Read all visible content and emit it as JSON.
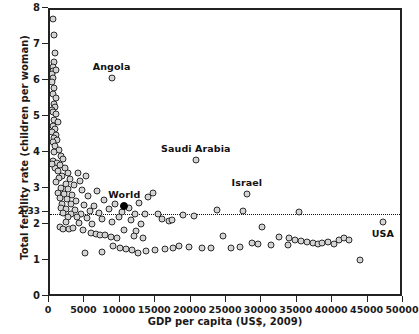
{
  "chart_data": {
    "type": "scatter",
    "title": "",
    "xlabel": "GDP per capita (US$, 2009)",
    "ylabel": "Total fertility rate (children per woman)",
    "xlim": [
      0,
      50000
    ],
    "ylim": [
      0,
      8
    ],
    "grid": false,
    "legend": "none",
    "xticks": [
      0,
      5000,
      10000,
      15000,
      20000,
      25000,
      30000,
      35000,
      40000,
      45000,
      50000
    ],
    "xticklabels": [
      "0",
      "5000",
      "10000",
      "15000",
      "20000",
      "25000",
      "30000",
      "35000",
      "40000",
      "45000",
      "50000"
    ],
    "yticks": [
      0,
      1,
      2,
      2.33,
      3,
      4,
      5,
      6,
      7,
      8
    ],
    "yticklabels": [
      "0",
      "1",
      "2",
      "2.33",
      "3",
      "4",
      "5",
      "6",
      "7",
      "8"
    ],
    "reference_lines": [
      {
        "axis": "y",
        "value": 2.33,
        "label": "2.33",
        "style": "dotted"
      }
    ],
    "marker_style": {
      "fill": "#d4d4d4",
      "edge": "#2b2b2b",
      "shape": "circle"
    },
    "highlight_style": {
      "fill": "#000000",
      "edge": "#000000"
    },
    "annotations": [
      {
        "label": "Angola",
        "x": 8700,
        "y": 6.1,
        "position": "above"
      },
      {
        "label": "Saudi Arabia",
        "x": 20600,
        "y": 3.82,
        "position": "above"
      },
      {
        "label": "World",
        "x": 10500,
        "y": 2.55,
        "position": "above"
      },
      {
        "label": "Israel",
        "x": 27800,
        "y": 2.9,
        "position": "above"
      },
      {
        "label": "USA",
        "x": 47000,
        "y": 2.12,
        "position": "below"
      }
    ],
    "highlight_points": [
      {
        "label": "World",
        "x": 10500,
        "y": 2.55
      }
    ],
    "points": [
      [
        420,
        7.74
      ],
      [
        600,
        7.3
      ],
      [
        700,
        6.8
      ],
      [
        520,
        6.55
      ],
      [
        450,
        6.42
      ],
      [
        380,
        6.3
      ],
      [
        330,
        6.22
      ],
      [
        900,
        6.33
      ],
      [
        470,
        6.12
      ],
      [
        350,
        6.0
      ],
      [
        600,
        5.82
      ],
      [
        420,
        5.66
      ],
      [
        800,
        5.55
      ],
      [
        500,
        5.4
      ],
      [
        640,
        5.3
      ],
      [
        300,
        5.22
      ],
      [
        380,
        5.18
      ],
      [
        900,
        5.1
      ],
      [
        560,
        4.95
      ],
      [
        1100,
        4.9
      ],
      [
        420,
        4.78
      ],
      [
        700,
        4.7
      ],
      [
        330,
        4.62
      ],
      [
        850,
        4.52
      ],
      [
        620,
        4.45
      ],
      [
        1000,
        4.4
      ],
      [
        480,
        4.32
      ],
      [
        760,
        4.22
      ],
      [
        1250,
        4.12
      ],
      [
        550,
        4.05
      ],
      [
        1600,
        3.95
      ],
      [
        1800,
        3.86
      ],
      [
        360,
        3.8
      ],
      [
        980,
        3.74
      ],
      [
        1400,
        3.7
      ],
      [
        700,
        3.62
      ],
      [
        2100,
        3.6
      ],
      [
        300,
        3.72
      ],
      [
        1150,
        3.52
      ],
      [
        2500,
        3.48
      ],
      [
        1700,
        3.4
      ],
      [
        3900,
        3.46
      ],
      [
        1300,
        3.33
      ],
      [
        2800,
        3.3
      ],
      [
        4200,
        3.26
      ],
      [
        900,
        3.22
      ],
      [
        2200,
        3.16
      ],
      [
        3400,
        3.14
      ],
      [
        5100,
        3.38
      ],
      [
        1500,
        3.05
      ],
      [
        2600,
        3.02
      ],
      [
        4500,
        3.0
      ],
      [
        6600,
        2.98
      ],
      [
        1100,
        2.92
      ],
      [
        2000,
        2.88
      ],
      [
        3100,
        2.86
      ],
      [
        5400,
        2.84
      ],
      [
        14500,
        2.92
      ],
      [
        1350,
        2.78
      ],
      [
        2400,
        2.74
      ],
      [
        3700,
        2.7
      ],
      [
        7600,
        2.72
      ],
      [
        13800,
        2.8
      ],
      [
        1700,
        2.62
      ],
      [
        2900,
        2.6
      ],
      [
        4800,
        2.58
      ],
      [
        6200,
        2.56
      ],
      [
        9200,
        2.62
      ],
      [
        12600,
        2.64
      ],
      [
        1500,
        2.5
      ],
      [
        2300,
        2.46
      ],
      [
        3500,
        2.44
      ],
      [
        5600,
        2.42
      ],
      [
        8400,
        2.48
      ],
      [
        11200,
        2.5
      ],
      [
        1900,
        2.36
      ],
      [
        3000,
        2.34
      ],
      [
        4400,
        2.33
      ],
      [
        6900,
        2.36
      ],
      [
        10100,
        2.38
      ],
      [
        12000,
        2.33
      ],
      [
        13400,
        2.33
      ],
      [
        15200,
        2.33
      ],
      [
        2600,
        2.26
      ],
      [
        3800,
        2.24
      ],
      [
        5200,
        2.22
      ],
      [
        7300,
        2.2
      ],
      [
        9800,
        2.24
      ],
      [
        11500,
        2.18
      ],
      [
        2200,
        2.12
      ],
      [
        4100,
        2.08
      ],
      [
        6000,
        2.06
      ],
      [
        8800,
        2.1
      ],
      [
        12900,
        2.06
      ],
      [
        16800,
        2.14
      ],
      [
        1400,
        1.96
      ],
      [
        1900,
        1.93
      ],
      [
        2700,
        1.92
      ],
      [
        3300,
        1.95
      ],
      [
        4700,
        1.9
      ],
      [
        10400,
        1.9
      ],
      [
        12200,
        1.86
      ],
      [
        30000,
        1.98
      ],
      [
        5800,
        1.8
      ],
      [
        6500,
        1.78
      ],
      [
        7100,
        1.76
      ],
      [
        7800,
        1.74
      ],
      [
        8600,
        1.7
      ],
      [
        9400,
        1.68
      ],
      [
        11800,
        1.72
      ],
      [
        13100,
        1.66
      ],
      [
        24500,
        1.72
      ],
      [
        32400,
        1.7
      ],
      [
        33800,
        1.66
      ],
      [
        34600,
        1.62
      ],
      [
        35400,
        1.58
      ],
      [
        36300,
        1.55
      ],
      [
        37100,
        1.52
      ],
      [
        37800,
        1.5
      ],
      [
        38400,
        1.52
      ],
      [
        39200,
        1.56
      ],
      [
        40100,
        1.5
      ],
      [
        40800,
        1.62
      ],
      [
        41500,
        1.66
      ],
      [
        42300,
        1.6
      ],
      [
        33600,
        1.46
      ],
      [
        31200,
        1.48
      ],
      [
        29400,
        1.5
      ],
      [
        28600,
        1.52
      ],
      [
        26800,
        1.42
      ],
      [
        25600,
        1.4
      ],
      [
        22800,
        1.38
      ],
      [
        21500,
        1.4
      ],
      [
        19600,
        1.42
      ],
      [
        18200,
        1.44
      ],
      [
        17400,
        1.38
      ],
      [
        16200,
        1.36
      ],
      [
        14800,
        1.34
      ],
      [
        13600,
        1.3
      ],
      [
        12400,
        1.26
      ],
      [
        11600,
        1.32
      ],
      [
        10800,
        1.36
      ],
      [
        9900,
        1.4
      ],
      [
        8900,
        1.44
      ],
      [
        7400,
        1.28
      ],
      [
        43800,
        1.06
      ],
      [
        27200,
        2.42
      ],
      [
        23600,
        2.44
      ],
      [
        18800,
        2.3
      ],
      [
        20400,
        2.28
      ],
      [
        15800,
        2.2
      ],
      [
        17200,
        2.16
      ],
      [
        5000,
        1.24
      ],
      [
        35200,
        2.38
      ]
    ]
  }
}
